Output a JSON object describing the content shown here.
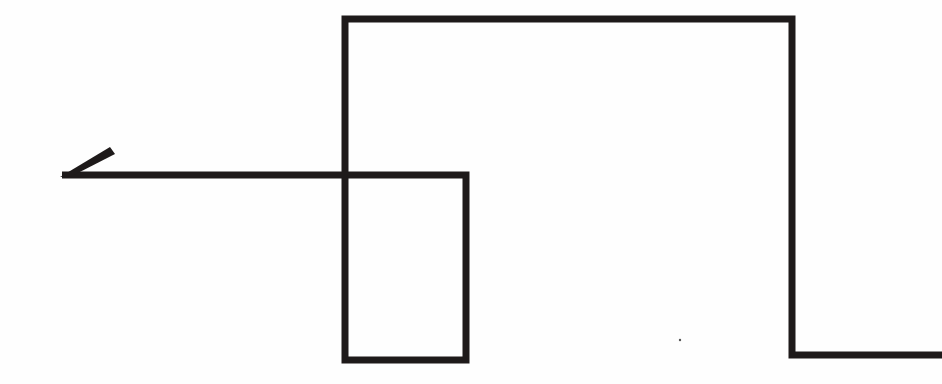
{
  "diagram": {
    "background": "#fefefe",
    "stroke_color": "#1e1a1a",
    "stroke_width": 7,
    "path": {
      "description": "Single continuous polyline with arrowhead at left end",
      "points": [
        [
          62,
          175
        ],
        [
          466,
          175
        ],
        [
          466,
          360
        ],
        [
          345,
          360
        ],
        [
          345,
          19
        ],
        [
          792,
          19
        ],
        [
          792,
          355
        ],
        [
          942,
          355
        ]
      ]
    },
    "arrowhead": {
      "tip": [
        62,
        176
      ],
      "barb_end": [
        113,
        150
      ],
      "direction": "left"
    },
    "artifact_dot": [
      680,
      340
    ]
  }
}
